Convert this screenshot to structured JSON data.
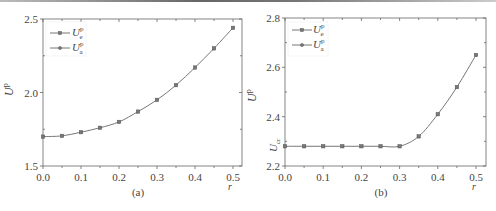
{
  "chart_data": [
    {
      "type": "line",
      "panel_label": "(a)",
      "xlabel": "r",
      "ylabel": "U^p",
      "xlim": [
        0.0,
        0.5
      ],
      "ylim": [
        1.5,
        2.5
      ],
      "xticks": [
        "0.0",
        "0.1",
        "0.2",
        "0.3",
        "0.4",
        "0.5"
      ],
      "yticks": [
        "1.5",
        "2.0",
        "2.5"
      ],
      "grid": false,
      "legend_position": "upper-left",
      "x": [
        0.0,
        0.05,
        0.1,
        0.15,
        0.2,
        0.25,
        0.3,
        0.35,
        0.4,
        0.45,
        0.5
      ],
      "series": [
        {
          "name": "U_e^p",
          "marker": "square",
          "values": [
            1.7,
            1.705,
            1.73,
            1.76,
            1.8,
            1.87,
            1.95,
            2.05,
            2.17,
            2.3,
            2.44
          ]
        },
        {
          "name": "U_a^p",
          "marker": "circle",
          "values": [
            1.7,
            1.705,
            1.73,
            1.76,
            1.8,
            1.87,
            1.95,
            2.05,
            2.17,
            2.3,
            2.44
          ]
        }
      ]
    },
    {
      "type": "line",
      "panel_label": "(b)",
      "xlabel": "r",
      "ylabel": "U^p",
      "annotation": "U_cr",
      "xlim": [
        0.0,
        0.5
      ],
      "ylim": [
        2.2,
        2.8
      ],
      "xticks": [
        "0.0",
        "0.1",
        "0.2",
        "0.3",
        "0.4",
        "0.5"
      ],
      "yticks": [
        "2.2",
        "2.4",
        "2.6",
        "2.8"
      ],
      "grid": false,
      "legend_position": "upper-left",
      "x": [
        0.0,
        0.05,
        0.1,
        0.15,
        0.2,
        0.25,
        0.3,
        0.35,
        0.4,
        0.45,
        0.5
      ],
      "series": [
        {
          "name": "U_e^p",
          "marker": "square",
          "values": [
            2.28,
            2.28,
            2.28,
            2.28,
            2.28,
            2.28,
            2.28,
            2.32,
            2.41,
            2.52,
            2.65
          ]
        },
        {
          "name": "U_a^p",
          "marker": "circle",
          "values": [
            2.28,
            2.28,
            2.28,
            2.28,
            2.28,
            2.28,
            2.28,
            2.32,
            2.41,
            2.52,
            2.65
          ]
        }
      ]
    }
  ],
  "panels": [
    {
      "label": "(a)",
      "xlabel": "r",
      "ylabel_main": "U",
      "ylabel_sup": "p",
      "legend": [
        {
          "main": "U",
          "sup": "p",
          "sub": "e"
        },
        {
          "main": "U",
          "sup": "p",
          "sub": "a"
        }
      ]
    },
    {
      "label": "(b)",
      "xlabel": "r",
      "ylabel_main": "U",
      "ylabel_sup": "p",
      "annotation_main": "U",
      "annotation_sub": "cr",
      "legend": [
        {
          "main": "U",
          "sup": "p",
          "sub": "e"
        },
        {
          "main": "U",
          "sup": "p",
          "sub": "a"
        }
      ]
    }
  ],
  "colors": {
    "line": "#777777",
    "axis": "#666666",
    "text": "#444444"
  }
}
